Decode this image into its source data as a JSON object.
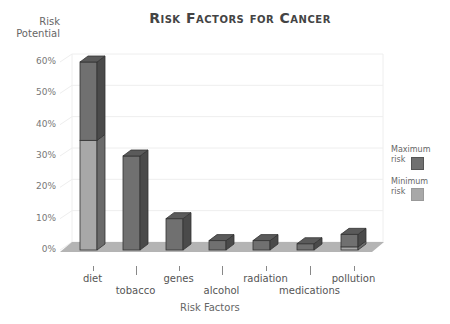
{
  "chart_data": {
    "type": "bar",
    "title": "Risk Factors for Cancer",
    "xlabel": "Risk Factors",
    "ylabel": "Risk Potential",
    "ylim": [
      0,
      60
    ],
    "yticks": [
      "0%",
      "10%",
      "20%",
      "30%",
      "40%",
      "50%",
      "60%"
    ],
    "categories": [
      "diet",
      "tobacco",
      "genes",
      "alcohol",
      "radiation",
      "medications",
      "pollution"
    ],
    "series": [
      {
        "name": "Minimum risk",
        "color": "#a8a8a8",
        "values": [
          35,
          30,
          10,
          3,
          3,
          2,
          1
        ]
      },
      {
        "name": "Maximum risk",
        "color": "#707070",
        "values": [
          60,
          30,
          10,
          3,
          3,
          2,
          5
        ]
      }
    ],
    "grid": true,
    "legend_position": "right",
    "style": "3d stacked column"
  },
  "legend": [
    {
      "label_line1": "Maximum",
      "label_line2": "risk",
      "color": "#707070"
    },
    {
      "label_line1": "Minimum",
      "label_line2": "risk",
      "color": "#a8a8a8"
    }
  ]
}
